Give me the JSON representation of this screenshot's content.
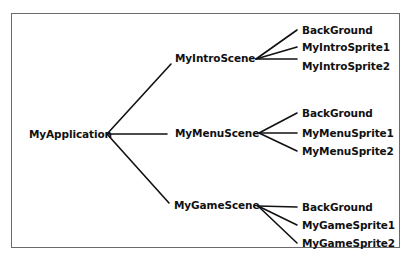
{
  "diagram": {
    "type": "tree",
    "colors": {
      "line": "#111111",
      "text": "#111111",
      "border": "#6b6b6b",
      "background": "#ffffff"
    },
    "root": {
      "label": "MyApplication",
      "children": [
        {
          "label": "MyIntroScene",
          "children": [
            {
              "label": "BackGround"
            },
            {
              "label": "MyIntroSprite1"
            },
            {
              "label": "MyIntroSprite2"
            }
          ]
        },
        {
          "label": "MyMenuScene",
          "children": [
            {
              "label": "BackGround"
            },
            {
              "label": "MyMenuSprite1"
            },
            {
              "label": "MyMenuSprite2"
            }
          ]
        },
        {
          "label": "MyGameScene",
          "children": [
            {
              "label": "BackGround"
            },
            {
              "label": "MyGameSprite1"
            },
            {
              "label": "MyGameSprite2"
            }
          ]
        }
      ]
    }
  }
}
